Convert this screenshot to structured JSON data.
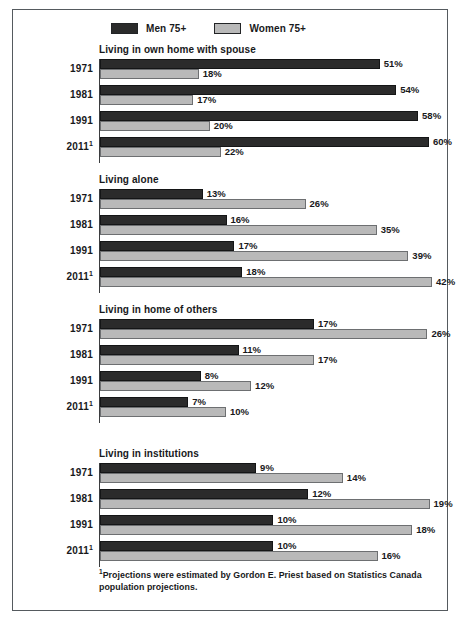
{
  "legend": {
    "entries": [
      {
        "label": "Men 75+",
        "color": "#2b2b2b",
        "icon": "legend-swatch-men"
      },
      {
        "label": "Women 75+",
        "color": "#b9b9b9",
        "icon": "legend-swatch-women"
      }
    ]
  },
  "footnote": {
    "marker": "1",
    "text": "Projections were estimated by Gordon E. Priest based on Statistics Canada population projections."
  },
  "chart_data": {
    "type": "bar",
    "orientation": "horizontal",
    "title": "",
    "xlabel": "",
    "ylabel": "",
    "grid": false,
    "legend_position": "top-left",
    "note": "Each panel is scaled independently so that its largest bar fills the plot width.",
    "series_names": [
      "Men 75+",
      "Women 75+"
    ],
    "series_colors": [
      "#2b2b2b",
      "#b9b9b9"
    ],
    "categories": [
      "1971",
      "1981",
      "1991",
      "2011"
    ],
    "category_labels": [
      "1971",
      "1981",
      "1991",
      "2011¹"
    ],
    "panels": [
      {
        "title": "Living in own home with spouse",
        "panel_max": 62,
        "rows": [
          {
            "year": "1971",
            "year_label": "1971",
            "men": 51,
            "women": 18,
            "men_label": "51%",
            "women_label": "18%"
          },
          {
            "year": "1981",
            "year_label": "1981",
            "men": 54,
            "women": 17,
            "men_label": "54%",
            "women_label": "17%"
          },
          {
            "year": "1991",
            "year_label": "1991",
            "men": 58,
            "women": 20,
            "men_label": "58%",
            "women_label": "20%"
          },
          {
            "year": "2011",
            "year_label": "2011",
            "men": 60,
            "women": 22,
            "men_label": "60%",
            "women_label": "22%",
            "footnote_marker": "1"
          }
        ]
      },
      {
        "title": "Living alone",
        "panel_max": 43,
        "rows": [
          {
            "year": "1971",
            "year_label": "1971",
            "men": 13,
            "women": 26,
            "men_label": "13%",
            "women_label": "26%"
          },
          {
            "year": "1981",
            "year_label": "1981",
            "men": 16,
            "women": 35,
            "men_label": "16%",
            "women_label": "35%"
          },
          {
            "year": "1991",
            "year_label": "1991",
            "men": 17,
            "women": 39,
            "men_label": "17%",
            "women_label": "39%"
          },
          {
            "year": "2011",
            "year_label": "2011",
            "men": 18,
            "women": 42,
            "men_label": "18%",
            "women_label": "42%",
            "footnote_marker": "1"
          }
        ]
      },
      {
        "title": "Living in home of others",
        "panel_max": 27,
        "rows": [
          {
            "year": "1971",
            "year_label": "1971",
            "men": 17,
            "women": 26,
            "men_label": "17%",
            "women_label": "26%"
          },
          {
            "year": "1981",
            "year_label": "1981",
            "men": 11,
            "women": 17,
            "men_label": "11%",
            "women_label": "17%"
          },
          {
            "year": "1991",
            "year_label": "1991",
            "men": 8,
            "women": 12,
            "men_label": "8%",
            "women_label": "12%"
          },
          {
            "year": "2011",
            "year_label": "2011",
            "men": 7,
            "women": 10,
            "men_label": "7%",
            "women_label": "10%",
            "footnote_marker": "1"
          }
        ]
      },
      {
        "title": "Living in institutions",
        "panel_max": 19.6,
        "rows": [
          {
            "year": "1971",
            "year_label": "1971",
            "men": 9,
            "women": 14,
            "men_label": "9%",
            "women_label": "14%"
          },
          {
            "year": "1981",
            "year_label": "1981",
            "men": 12,
            "women": 19,
            "men_label": "12%",
            "women_label": "19%"
          },
          {
            "year": "1991",
            "year_label": "1991",
            "men": 10,
            "women": 18,
            "men_label": "10%",
            "women_label": "18%"
          },
          {
            "year": "2011",
            "year_label": "2011",
            "men": 10,
            "women": 16,
            "men_label": "10%",
            "women_label": "16%",
            "footnote_marker": "1"
          }
        ]
      }
    ]
  }
}
